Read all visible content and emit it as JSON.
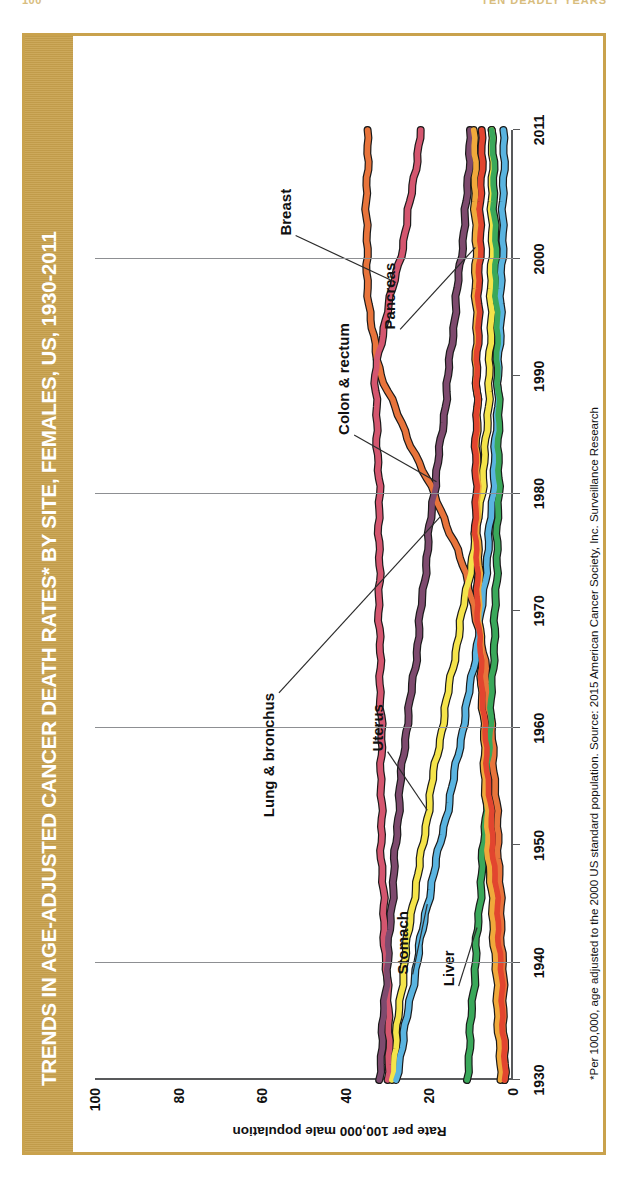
{
  "page": {
    "number": "100",
    "running_head": "TEN DEADLY YEARS"
  },
  "figure": {
    "title": "TRENDS IN AGE-ADJUSTED CANCER DEATH RATES* BY SITE, FEMALES, US, 1930-2011",
    "band_color": "#c9a24d",
    "footnote": "*Per 100,000, age adjusted to the 2000 US standard population.   Source: 2015 American Cancer Society, Inc. Surveillance Research"
  },
  "chart_data": {
    "type": "line",
    "title": "TRENDS IN AGE-ADJUSTED CANCER DEATH RATES* BY SITE, FEMALES, US, 1930-2011",
    "xlabel": "",
    "ylabel": "Rate per 100,000 male population",
    "xlim": [
      1930,
      2011
    ],
    "ylim": [
      0,
      100
    ],
    "yticks": [
      0,
      20,
      40,
      60,
      80,
      100
    ],
    "xticks": [
      1930,
      1940,
      1950,
      1960,
      1970,
      1980,
      1990,
      2000,
      2011
    ],
    "gridlines": "vertical at 1940,1960,1980,2000",
    "legend": "inline labels with leader lines",
    "x": [
      1930,
      1935,
      1940,
      1945,
      1950,
      1955,
      1960,
      1965,
      1970,
      1975,
      1980,
      1985,
      1990,
      1995,
      2000,
      2005,
      2011
    ],
    "series": [
      {
        "name": "Lung & bronchus",
        "color": "#e8743b",
        "values": [
          2.0,
          2.2,
          2.5,
          3.0,
          3.5,
          4.2,
          5.2,
          6.5,
          9.0,
          13.0,
          19.0,
          25.5,
          31.5,
          34.3,
          35.0,
          35.0,
          34.7
        ]
      },
      {
        "name": "Breast",
        "color": "#d4566f",
        "values": [
          30.0,
          29.5,
          30.5,
          31.0,
          31.5,
          31.5,
          31.5,
          31.8,
          32.0,
          32.0,
          32.0,
          32.5,
          33.0,
          30.5,
          27.0,
          24.5,
          22.0
        ]
      },
      {
        "name": "Colon & rectum",
        "color": "#7e4a6e",
        "values": [
          32.0,
          31.0,
          30.0,
          29.0,
          28.0,
          27.0,
          25.5,
          23.5,
          22.0,
          20.5,
          19.0,
          17.0,
          15.5,
          14.0,
          12.5,
          11.0,
          10.2
        ]
      },
      {
        "name": "Uterus",
        "color": "#f5e44a",
        "values": [
          29.0,
          27.5,
          26.0,
          24.0,
          21.5,
          19.5,
          17.0,
          14.5,
          12.0,
          9.5,
          7.5,
          6.3,
          5.6,
          5.3,
          5.1,
          5.0,
          5.0
        ]
      },
      {
        "name": "Stomach",
        "color": "#5ab4e0",
        "values": [
          28.0,
          25.5,
          23.0,
          20.5,
          17.5,
          14.5,
          12.0,
          9.5,
          7.5,
          6.0,
          4.8,
          4.0,
          3.5,
          3.0,
          2.6,
          2.3,
          2.2
        ]
      },
      {
        "name": "Liver",
        "color": "#3aa85a",
        "values": [
          11.0,
          10.0,
          9.0,
          8.0,
          7.0,
          6.2,
          5.5,
          4.8,
          4.2,
          3.8,
          3.5,
          3.4,
          3.6,
          3.9,
          4.2,
          4.5,
          5.0
        ]
      },
      {
        "name": "Pancreas",
        "color": "#f0a93b",
        "values": [
          3.0,
          3.5,
          4.2,
          5.0,
          6.0,
          6.6,
          7.0,
          7.6,
          8.0,
          8.3,
          8.5,
          8.6,
          8.7,
          8.8,
          8.9,
          9.0,
          9.3
        ]
      },
      {
        "name": "Ovary",
        "color": "#e2452f",
        "values": [
          2.0,
          2.4,
          3.0,
          3.8,
          4.8,
          5.8,
          6.8,
          7.6,
          8.4,
          8.8,
          8.9,
          8.8,
          8.6,
          8.3,
          8.0,
          7.7,
          7.4
        ]
      }
    ],
    "annotations": [
      {
        "label": "Lung & bronchus"
      },
      {
        "label": "Breast"
      },
      {
        "label": "Colon & rectum"
      },
      {
        "label": "Uterus"
      },
      {
        "label": "Stomach"
      },
      {
        "label": "Liver"
      },
      {
        "label": "Pancreas"
      }
    ]
  }
}
